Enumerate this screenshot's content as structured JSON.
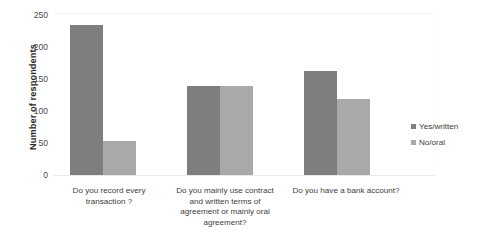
{
  "chart_data": {
    "type": "bar",
    "title": "",
    "subtitle": "",
    "xlabel": "",
    "ylabel": "Number of respondents",
    "ylim": [
      0,
      250
    ],
    "yticks": [
      0,
      50,
      100,
      150,
      200,
      250
    ],
    "grid": false,
    "legend_position": "right",
    "categories": [
      "Do you record every transaction ?",
      "Do you mainly use contract and written terms of agreement or mainly oral agreement?",
      "Do you have a bank account?"
    ],
    "series": [
      {
        "name": "Yes/written",
        "color": "#7e7e7e",
        "values": [
          232,
          137,
          160
        ]
      },
      {
        "name": "No/oral",
        "color": "#a9a9a9",
        "values": [
          53,
          137,
          118
        ]
      }
    ]
  },
  "axis": {
    "y_title": "Number of respondents",
    "y_tick_labels": [
      "250",
      "200",
      "150",
      "100",
      "50",
      "0"
    ]
  },
  "categories": {
    "0": {
      "line1": "Do you record every",
      "line2": "transaction ?",
      "line3": "",
      "line4": ""
    },
    "1": {
      "line1": "Do you mainly use contract",
      "line2": "and written terms of",
      "line3": "agreement or mainly oral",
      "line4": "agreement?"
    },
    "2": {
      "line1": "Do you have a bank account?",
      "line2": "",
      "line3": "",
      "line4": ""
    }
  },
  "legend": {
    "items": [
      {
        "label": "Yes/written",
        "color": "#7e7e7e"
      },
      {
        "label": "No/oral",
        "color": "#a9a9a9"
      }
    ]
  }
}
